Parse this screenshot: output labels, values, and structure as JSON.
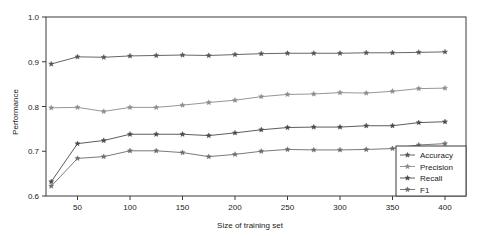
{
  "chart_data": {
    "type": "line",
    "title": "",
    "xlabel": "Size of training set",
    "ylabel": "Performance",
    "xlim": [
      20,
      420
    ],
    "ylim": [
      0.6,
      1.0
    ],
    "grid": false,
    "legend_position": "bottom-right",
    "x": [
      25,
      50,
      75,
      100,
      125,
      150,
      175,
      200,
      225,
      250,
      275,
      300,
      325,
      350,
      375,
      400
    ],
    "xticks": [
      50,
      100,
      150,
      200,
      250,
      300,
      350,
      400
    ],
    "xtick_labels": [
      "50",
      "100",
      "150",
      "200",
      "250",
      "300",
      "350",
      "400"
    ],
    "yticks": [
      0.6,
      0.7,
      0.8,
      0.9,
      1.0
    ],
    "ytick_labels": [
      "0.6",
      "0.7",
      "0.8",
      "0.9",
      "1.0"
    ],
    "series": [
      {
        "name": "Accuracy",
        "color": "#555555",
        "marker": "star",
        "values": [
          0.895,
          0.911,
          0.91,
          0.913,
          0.914,
          0.915,
          0.914,
          0.916,
          0.918,
          0.919,
          0.919,
          0.919,
          0.92,
          0.92,
          0.921,
          0.922
        ]
      },
      {
        "name": "Precision",
        "color": "#8a8a8a",
        "marker": "star",
        "values": [
          0.797,
          0.798,
          0.789,
          0.798,
          0.798,
          0.803,
          0.809,
          0.814,
          0.822,
          0.827,
          0.828,
          0.831,
          0.83,
          0.834,
          0.84,
          0.841
        ]
      },
      {
        "name": "Recall",
        "color": "#4a4a4a",
        "marker": "star",
        "values": [
          0.632,
          0.717,
          0.724,
          0.738,
          0.738,
          0.738,
          0.735,
          0.741,
          0.748,
          0.753,
          0.754,
          0.754,
          0.757,
          0.757,
          0.764,
          0.766
        ]
      },
      {
        "name": "F1",
        "color": "#6a6a6a",
        "marker": "star",
        "values": [
          0.622,
          0.684,
          0.688,
          0.701,
          0.701,
          0.697,
          0.688,
          0.693,
          0.7,
          0.704,
          0.703,
          0.703,
          0.704,
          0.706,
          0.714,
          0.717
        ]
      }
    ]
  },
  "legend": {
    "entries": [
      "Accuracy",
      "Precision",
      "Recall",
      "F1"
    ]
  },
  "axes": {
    "x_title": "Size of training set",
    "y_title": "Performance"
  }
}
